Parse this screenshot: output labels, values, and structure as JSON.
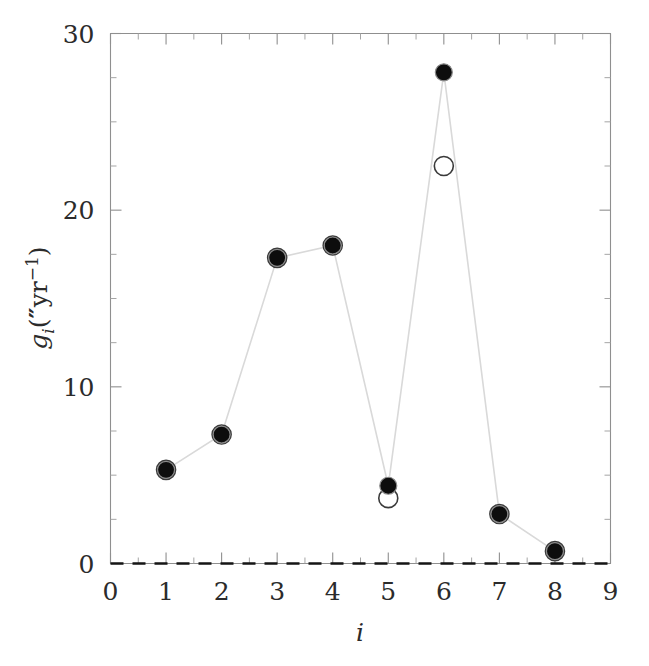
{
  "chart_data": {
    "type": "scatter",
    "title": "",
    "subtitle": "",
    "xlabel": "i",
    "ylabel": "g_i(″yr⁻¹)",
    "xlim": [
      0,
      9
    ],
    "ylim": [
      0,
      30
    ],
    "grid": false,
    "legend": "none",
    "x": [
      1,
      2,
      3,
      4,
      5,
      6,
      7,
      8
    ],
    "xticks": [
      "0",
      "1",
      "2",
      "3",
      "4",
      "5",
      "6",
      "7",
      "8",
      "9"
    ],
    "xtick_values": [
      0,
      1,
      2,
      3,
      4,
      5,
      6,
      7,
      8,
      9
    ],
    "yticks": [
      "0",
      "10",
      "20",
      "30"
    ],
    "ytick_values": [
      0,
      10,
      20,
      30
    ],
    "xminor_step": 0.5,
    "yminor_step": 2.5,
    "annotations": [
      {
        "kind": "dashed-horizontal-line",
        "y": 0,
        "label": "zero reference line"
      }
    ],
    "series": [
      {
        "name": "filled",
        "marker": "filled-circle",
        "connected": true,
        "values": [
          5.3,
          7.3,
          17.3,
          18.0,
          4.4,
          27.8,
          2.8,
          0.7
        ]
      },
      {
        "name": "open",
        "marker": "open-circle",
        "connected": false,
        "values": [
          5.3,
          7.3,
          17.3,
          18.0,
          3.7,
          22.5,
          2.8,
          0.7
        ]
      }
    ]
  },
  "labels": {
    "ylabel_parts": {
      "g": "g",
      "sub_i": "i",
      "open_paren": "(",
      "arcsec": "″",
      "yr": "yr",
      "exp": "−1",
      "close_paren": ")"
    },
    "xlabel_text": "i"
  }
}
